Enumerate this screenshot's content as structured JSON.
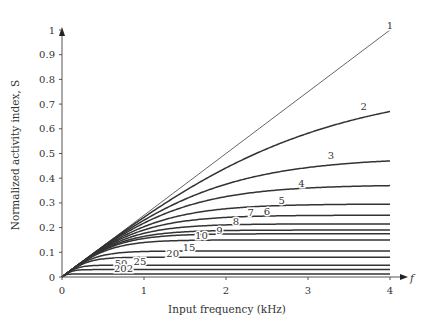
{
  "chart_data": {
    "type": "line",
    "title": "",
    "xlabel": "Input frequency (kHz)",
    "ylabel": "Normalized activity index, S",
    "x_axis_symbol": "f",
    "xlim": [
      0,
      4
    ],
    "ylim": [
      0,
      1
    ],
    "x_ticks": [
      "0",
      "1",
      "2",
      "3",
      "4"
    ],
    "y_ticks": [
      "0",
      "0.1",
      "0.2",
      "0.3",
      "0.4",
      "0.5",
      "0.6",
      "0.7",
      "0.8",
      "0.9",
      "1"
    ],
    "grid": false,
    "legend": "inline curve labels",
    "series": [
      {
        "name": "1",
        "value_at_4kHz": 1.0,
        "linear": true,
        "label_pos": [
          4.0,
          1.02
        ]
      },
      {
        "name": "2",
        "value_at_4kHz": 0.67,
        "label_pos": [
          3.68,
          0.69
        ]
      },
      {
        "name": "3",
        "value_at_4kHz": 0.47,
        "label_pos": [
          3.28,
          0.49
        ]
      },
      {
        "name": "4",
        "value_at_4kHz": 0.37,
        "label_pos": [
          2.92,
          0.38
        ]
      },
      {
        "name": "5",
        "value_at_4kHz": 0.295,
        "label_pos": [
          2.68,
          0.31
        ]
      },
      {
        "name": "6",
        "value_at_4kHz": 0.25,
        "label_pos": [
          2.5,
          0.265
        ]
      },
      {
        "name": "7",
        "value_at_4kHz": 0.215,
        "label_pos": [
          2.3,
          0.26
        ]
      },
      {
        "name": "8",
        "value_at_4kHz": 0.19,
        "label_pos": [
          2.12,
          0.225
        ]
      },
      {
        "name": "9",
        "value_at_4kHz": 0.175,
        "label_pos": [
          1.92,
          0.19
        ]
      },
      {
        "name": "10",
        "value_at_4kHz": 0.15,
        "label_pos": [
          1.7,
          0.17
        ]
      },
      {
        "name": "15",
        "value_at_4kHz": 0.105,
        "label_pos": [
          1.55,
          0.12
        ]
      },
      {
        "name": "20",
        "value_at_4kHz": 0.08,
        "label_pos": [
          1.35,
          0.095
        ]
      },
      {
        "name": "25",
        "value_at_4kHz": 0.048,
        "label_pos": [
          0.95,
          0.062
        ]
      },
      {
        "name": "50",
        "value_at_4kHz": 0.03,
        "label_pos": [
          0.72,
          0.053
        ]
      },
      {
        "name": "202",
        "value_at_4kHz": 0.012,
        "label_pos": [
          0.75,
          0.035
        ]
      }
    ]
  }
}
